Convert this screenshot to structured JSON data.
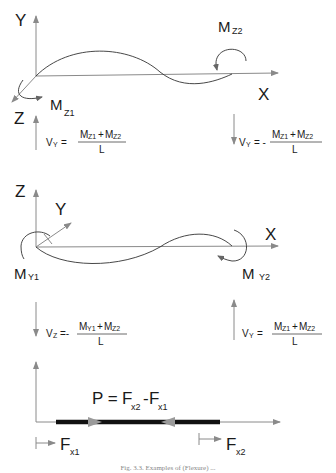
{
  "panel_z_moment": {
    "axis_y": "Y",
    "axis_x": "X",
    "axis_z": "Z",
    "moment_start": {
      "main": "M",
      "sub": "Z1"
    },
    "moment_end": {
      "main": "M",
      "sub": "Z2"
    },
    "shear_left": {
      "lhs_main": "V",
      "lhs_sub": "Y",
      "sign": "=",
      "num": {
        "a_main": "M",
        "a_sub": "Z1",
        "op": "+",
        "b_main": "M",
        "b_sub": "Z2"
      },
      "den": "L"
    },
    "shear_right": {
      "lhs_main": "V",
      "lhs_sub": "Y",
      "sign": "= -",
      "num": {
        "a_main": "M",
        "a_sub": "Z1",
        "op": "+",
        "b_main": "M",
        "b_sub": "Z2"
      },
      "den": "L"
    }
  },
  "panel_y_moment": {
    "axis_z": "Z",
    "axis_y": "Y",
    "axis_x": "X",
    "moment_start": {
      "main": "M",
      "sub": "Y1"
    },
    "moment_end": {
      "main": "M",
      "sub": "Y2"
    },
    "shear_left": {
      "lhs_main": "V",
      "lhs_sub": "Z",
      "sign": "=-",
      "num": {
        "a_main": "M",
        "a_sub": "Y1",
        "op": "+",
        "b_main": "M",
        "b_sub": "Z2"
      },
      "den": "L"
    },
    "shear_right": {
      "lhs_main": "V",
      "lhs_sub": "Y",
      "sign": "=",
      "num": {
        "a_main": "M",
        "a_sub": "Z1",
        "op": "+",
        "b_main": "M",
        "b_sub": "Z2"
      },
      "den": "L"
    }
  },
  "panel_axial": {
    "equation": {
      "lhs": "P =",
      "a_main": "F",
      "a_sub": "x2",
      "op": "-",
      "b_main": "F",
      "b_sub": "x1"
    },
    "force_start": {
      "main": "F",
      "sub": "x1"
    },
    "force_end": {
      "main": "F",
      "sub": "x2"
    }
  },
  "caption": "Fig. 3.3. Examples of (Flexure) ..."
}
